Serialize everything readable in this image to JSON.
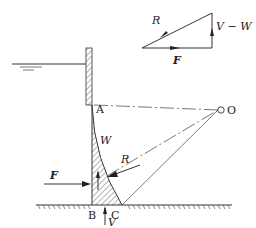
{
  "diagram": {
    "points": {
      "A": "A",
      "B": "B",
      "C": "C",
      "O": "O"
    },
    "forces": {
      "F": "F",
      "R": "R",
      "W": "W",
      "V": "V"
    },
    "triangle": {
      "R": "R",
      "F": "F",
      "V_minus_W": "V − W"
    }
  }
}
